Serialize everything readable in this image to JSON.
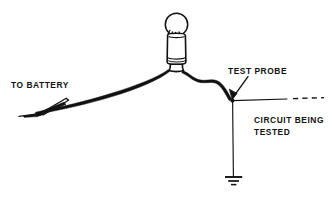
{
  "figure": {
    "background_color": "#ffffff",
    "ink_color": "#111111",
    "width": 331,
    "height": 198
  },
  "labels": {
    "to_battery": "TO BATTERY",
    "test_probe": "TEST PROBE",
    "circuit_being_tested_line1": "CIRCUIT BEING",
    "circuit_being_tested_line2": "TESTED"
  },
  "components": {
    "lamp": {
      "name": "test-lamp",
      "bulb_shape": "circle",
      "housing_shape": "rounded-cylinder"
    },
    "alligator_clip": {
      "name": "alligator-clip",
      "position": "left-end-of-battery-lead"
    },
    "test_probe": {
      "name": "test-probe-tip",
      "position": "junction-with-circuit-line"
    },
    "ground": {
      "name": "ground-symbol",
      "bars": 3
    },
    "circuit_line": {
      "name": "circuit-under-test-line",
      "style": "solid-then-dashed",
      "dash_count": 4
    }
  }
}
